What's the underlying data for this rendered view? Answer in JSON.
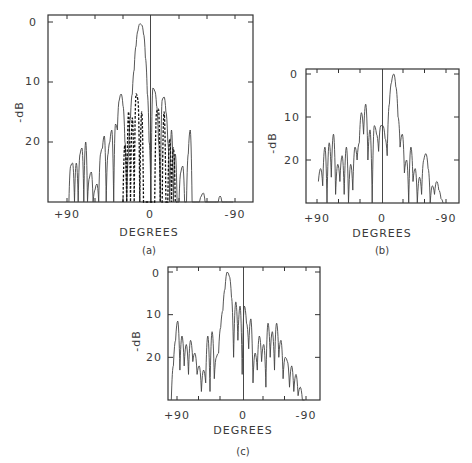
{
  "figure": {
    "panels": [
      {
        "id": "a",
        "caption": "(a)",
        "xlabel": "DEGREES",
        "ylabel": "-dB",
        "x_ticks": [
          "+90",
          "0",
          "-90"
        ],
        "y_ticks": [
          "0",
          "10",
          "20"
        ]
      },
      {
        "id": "b",
        "caption": "(b)",
        "xlabel": "DEGREES",
        "ylabel": "-dB",
        "x_ticks": [
          "+90",
          "0",
          "-90"
        ],
        "y_ticks": [
          "0",
          "10",
          "20"
        ]
      },
      {
        "id": "c",
        "caption": "(c)",
        "xlabel": "DEGREES",
        "ylabel": "-dB",
        "x_ticks": [
          "+90",
          "0",
          "-90"
        ],
        "y_ticks": [
          "0",
          "10",
          "20"
        ]
      }
    ]
  },
  "chart_data": [
    {
      "type": "line",
      "title": "(a)",
      "xlabel": "DEGREES",
      "ylabel": "-dB",
      "xlim": [
        90,
        -90
      ],
      "ylim": [
        0,
        30
      ],
      "x_tick_labels": [
        "+90",
        "0",
        "-90"
      ],
      "y_tick_labels": [
        "0",
        "10",
        "20"
      ],
      "grid": false,
      "series": [
        {
          "name": "solid pattern",
          "style": "solid",
          "x": [
            88,
            86,
            84,
            82,
            80,
            78,
            76,
            74,
            72,
            70,
            68,
            66,
            64,
            62,
            60,
            58,
            56,
            54,
            52,
            50,
            48,
            46,
            44,
            42,
            40,
            38,
            36,
            34,
            32,
            30,
            28,
            26,
            24,
            22,
            20,
            18,
            16,
            14,
            12,
            10,
            8,
            6,
            4,
            2,
            0,
            -2,
            -4,
            -6,
            -8,
            -10,
            -12,
            -14,
            -16,
            -18,
            -20,
            -22,
            -24,
            -26,
            -28,
            -30,
            -32,
            -34,
            -36,
            -38,
            -40,
            -42,
            -44,
            -46,
            -48,
            -50,
            -52,
            -54,
            -56,
            -58,
            -60,
            -62,
            -64,
            -66,
            -68,
            -70,
            -72,
            -74,
            -76,
            -78,
            -80,
            -82,
            -84,
            -86,
            -88
          ],
          "y": [
            30,
            24,
            23.5,
            30,
            23.5,
            30,
            22,
            21,
            30,
            20,
            30,
            26,
            25,
            30,
            28,
            27,
            30,
            22,
            21,
            19,
            30,
            22,
            20,
            18,
            30,
            17,
            18,
            13,
            12,
            14,
            20,
            30,
            22,
            16,
            12,
            8,
            4,
            1.5,
            0.3,
            0.5,
            2,
            6,
            12,
            20,
            30,
            11,
            11.5,
            14,
            20,
            30,
            13,
            12.5,
            15,
            20,
            30,
            18,
            30,
            22,
            30,
            30,
            25,
            24,
            30,
            30,
            22,
            18,
            30,
            30,
            30,
            30,
            30,
            29,
            28.5,
            30,
            30,
            30,
            30,
            30,
            30,
            30,
            30,
            29,
            30,
            30,
            30,
            30,
            30,
            30,
            30
          ]
        },
        {
          "name": "dashed pattern",
          "style": "dashed",
          "x": [
            30,
            28,
            26,
            24,
            22,
            20,
            18,
            16,
            14,
            12,
            10,
            8,
            6,
            4,
            2,
            0,
            -2,
            -4,
            -6,
            -8,
            -10,
            -12,
            -14,
            -16,
            -18,
            -20,
            -22,
            -24,
            -26,
            -28
          ],
          "y": [
            30,
            20.5,
            30,
            15,
            30,
            16,
            30,
            12,
            13,
            30,
            15,
            30,
            30,
            30,
            30,
            30,
            30,
            30,
            15,
            14.5,
            30,
            30,
            15,
            30,
            30,
            19.5,
            30,
            21,
            30,
            30
          ]
        }
      ]
    },
    {
      "type": "line",
      "title": "(b)",
      "xlabel": "DEGREES",
      "ylabel": "-dB",
      "xlim": [
        90,
        -90
      ],
      "ylim": [
        0,
        30
      ],
      "x_tick_labels": [
        "+90",
        "0",
        "-90"
      ],
      "y_tick_labels": [
        "0",
        "10",
        "20"
      ],
      "grid": false,
      "series": [
        {
          "name": "pattern",
          "style": "solid",
          "x": [
            88,
            85,
            82,
            79,
            76,
            73,
            70,
            67,
            64,
            61,
            58,
            55,
            52,
            49,
            46,
            43,
            40,
            37,
            34,
            31,
            28,
            25,
            22,
            19,
            16,
            13,
            10,
            7,
            4,
            1,
            -2,
            -5,
            -8,
            -11,
            -14,
            -17,
            -20,
            -23,
            -26,
            -29,
            -32,
            -35,
            -38,
            -41,
            -44,
            -47,
            -50,
            -53,
            -56,
            -59,
            -62,
            -65,
            -68,
            -71,
            -74,
            -77,
            -80,
            -83,
            -86
          ],
          "y": [
            25,
            22,
            26,
            17,
            30,
            16,
            24,
            14,
            28,
            21,
            25,
            19,
            28,
            17,
            30,
            21,
            27,
            17,
            20,
            16,
            9,
            14,
            7,
            20,
            13,
            30,
            12,
            14,
            18,
            12,
            12,
            15,
            19,
            7,
            2,
            0,
            3,
            10,
            17,
            14,
            23,
            20,
            30,
            17,
            25,
            22,
            30,
            24,
            28,
            20,
            18.5,
            22,
            30,
            26,
            28,
            25,
            27,
            29,
            30
          ]
        }
      ]
    },
    {
      "type": "line",
      "title": "(c)",
      "xlabel": "DEGREES",
      "ylabel": "-dB",
      "xlim": [
        90,
        -90
      ],
      "ylim": [
        0,
        30
      ],
      "x_tick_labels": [
        "+90",
        "0",
        "-90"
      ],
      "y_tick_labels": [
        "0",
        "10",
        "20"
      ],
      "grid": false,
      "series": [
        {
          "name": "pattern",
          "style": "solid",
          "x": [
            98,
            95,
            92,
            89,
            86,
            83,
            80,
            77,
            74,
            71,
            68,
            65,
            62,
            59,
            56,
            53,
            50,
            47,
            44,
            41,
            38,
            35,
            32,
            29,
            26,
            23,
            20,
            17,
            14,
            11,
            8,
            5,
            2,
            -1,
            -4,
            -7,
            -10,
            -13,
            -16,
            -19,
            -22,
            -25,
            -28,
            -31,
            -34,
            -37,
            -40,
            -43,
            -46,
            -49,
            -52,
            -55,
            -58,
            -61,
            -64,
            -67,
            -70,
            -73,
            -76,
            -79,
            -82,
            -85,
            -88
          ],
          "y": [
            30,
            22,
            16,
            11.5,
            23,
            15,
            22,
            17,
            24,
            16,
            21,
            19,
            24,
            22,
            28,
            23,
            26,
            15,
            28,
            14,
            25,
            20,
            19,
            13,
            9,
            4,
            0,
            1,
            6,
            20,
            7,
            16,
            8,
            24,
            8,
            12,
            18,
            11,
            26,
            19,
            23,
            15,
            21,
            17,
            27,
            12,
            20,
            14,
            23,
            12,
            20,
            16,
            25,
            20,
            21,
            27,
            22,
            28,
            24,
            29,
            27,
            30,
            30
          ]
        }
      ]
    }
  ]
}
